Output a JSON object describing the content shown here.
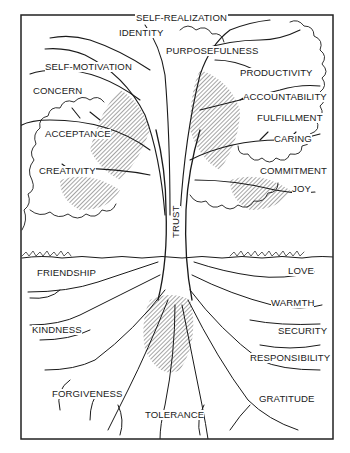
{
  "diagram": {
    "type": "tree-of-values-illustration",
    "trunk_label": "TRUST",
    "crown_labels": [
      {
        "text": "SELF-REALIZATION",
        "x": 135,
        "y": 19
      },
      {
        "text": "IDENTITY",
        "x": 119,
        "y": 32
      },
      {
        "text": "PURPOSEFULNESS",
        "x": 166,
        "y": 50
      },
      {
        "text": "SELF-MOTIVATION",
        "x": 45,
        "y": 65
      },
      {
        "text": "PRODUCTIVITY",
        "x": 240,
        "y": 70
      },
      {
        "text": "CONCERN",
        "x": 33,
        "y": 89
      },
      {
        "text": "ACCOUNTABILITY",
        "x": 243,
        "y": 94
      },
      {
        "text": "FULFILLMENT",
        "x": 257,
        "y": 114
      },
      {
        "text": "ACCEPTANCE",
        "x": 45,
        "y": 129
      },
      {
        "text": "CARING",
        "x": 274,
        "y": 135
      },
      {
        "text": "CREATIVITY",
        "x": 39,
        "y": 167
      },
      {
        "text": "COMMITMENT",
        "x": 260,
        "y": 167
      },
      {
        "text": "JOY",
        "x": 292,
        "y": 185
      }
    ],
    "root_labels": [
      {
        "text": "FRIENDSHIP",
        "x": 37,
        "y": 270
      },
      {
        "text": "LOVE",
        "x": 288,
        "y": 268
      },
      {
        "text": "WARMTH",
        "x": 271,
        "y": 300
      },
      {
        "text": "KINDNESS",
        "x": 32,
        "y": 326
      },
      {
        "text": "SECURITY",
        "x": 278,
        "y": 328
      },
      {
        "text": "RESPONSIBILITY",
        "x": 250,
        "y": 355
      },
      {
        "text": "FORGIVENESS",
        "x": 52,
        "y": 390
      },
      {
        "text": "GRATITUDE",
        "x": 259,
        "y": 396
      },
      {
        "text": "TOLERANCE",
        "x": 145,
        "y": 411
      }
    ]
  },
  "colors": {
    "ink": "#1a1a1a",
    "background": "#ffffff",
    "frame": "#222222"
  }
}
